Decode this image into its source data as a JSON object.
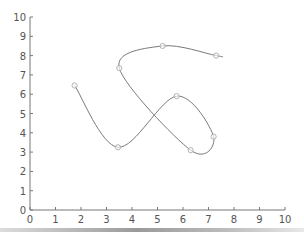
{
  "chart_data": {
    "type": "line",
    "title": "",
    "xlabel": "",
    "ylabel": "",
    "xlim": [
      0,
      10
    ],
    "ylim": [
      0,
      10
    ],
    "x_ticks": [
      "0",
      "1",
      "2",
      "3",
      "4",
      "5",
      "6",
      "7",
      "8",
      "9",
      "10"
    ],
    "y_ticks": [
      "0",
      "1",
      "2",
      "3",
      "4",
      "5",
      "6",
      "7",
      "8",
      "9",
      "10"
    ],
    "grid": false,
    "legend": null,
    "series": [
      {
        "name": "smooth curve",
        "color": "#7a7a7a",
        "marker": "open-circle",
        "points": [
          {
            "x": 1.75,
            "y": 6.45
          },
          {
            "x": 3.45,
            "y": 3.25
          },
          {
            "x": 5.75,
            "y": 5.9
          },
          {
            "x": 7.2,
            "y": 3.8
          },
          {
            "x": 6.3,
            "y": 3.1
          },
          {
            "x": 3.5,
            "y": 7.35
          },
          {
            "x": 5.2,
            "y": 8.5
          },
          {
            "x": 7.3,
            "y": 8.0
          }
        ]
      }
    ]
  },
  "colors": {
    "axis": "#777777",
    "line": "#7a7a7a",
    "marker_stroke": "#aaaaaa"
  }
}
